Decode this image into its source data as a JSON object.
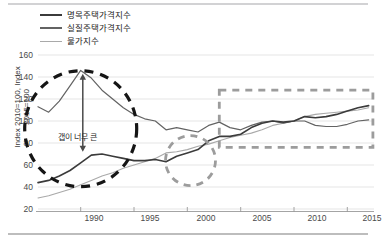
{
  "chart_data": {
    "type": "line",
    "title": "",
    "xlabel": "",
    "ylabel": "Index 2010=100, Index 2015=100",
    "xlim": [
      1986,
      2017.5
    ],
    "ylim": [
      20,
      160
    ],
    "yticks": [
      20,
      40,
      60,
      80,
      100,
      120,
      140,
      160
    ],
    "xticks": [
      1990,
      1995,
      2000,
      2005,
      2010,
      2015
    ],
    "grid": true,
    "legend_position": "top-left",
    "series": [
      {
        "name": "명목주택가격지수",
        "color": "#3b3b3b",
        "x": [
          1986,
          1987,
          1988,
          1989,
          1990,
          1991,
          1992,
          1993,
          1994,
          1995,
          1996,
          1997,
          1998,
          1999,
          2000,
          2001,
          2002,
          2003,
          2004,
          2005,
          2006,
          2007,
          2008,
          2009,
          2010,
          2011,
          2012,
          2013,
          2014,
          2015,
          2016,
          2017
        ],
        "values": [
          44,
          46,
          50,
          55,
          62,
          69,
          70,
          68,
          66,
          64,
          64,
          65,
          63,
          68,
          71,
          74,
          82,
          86,
          86,
          88,
          94,
          98,
          100,
          99,
          100,
          104,
          103,
          104,
          106,
          109,
          112,
          114
        ]
      },
      {
        "name": "실질주택가격지수",
        "color": "#636363",
        "x": [
          1986,
          1987,
          1988,
          1989,
          1990,
          1991,
          1992,
          1993,
          1994,
          1995,
          1996,
          1997,
          1998,
          1999,
          2000,
          2001,
          2002,
          2003,
          2004,
          2005,
          2006,
          2007,
          2008,
          2009,
          2010,
          2011,
          2012,
          2013,
          2014,
          2015,
          2016,
          2017
        ],
        "values": [
          113,
          108,
          118,
          132,
          146,
          139,
          128,
          120,
          112,
          106,
          102,
          100,
          92,
          94,
          92,
          90,
          96,
          99,
          94,
          92,
          96,
          99,
          100,
          98,
          100,
          100,
          96,
          95,
          95,
          97,
          100,
          101
        ]
      },
      {
        "name": "물가지수",
        "color": "#a9a9a9",
        "x": [
          1986,
          1987,
          1988,
          1989,
          1990,
          1991,
          1992,
          1993,
          1994,
          1995,
          1996,
          1997,
          1998,
          1999,
          2000,
          2001,
          2002,
          2003,
          2004,
          2005,
          2006,
          2007,
          2008,
          2009,
          2010,
          2011,
          2012,
          2013,
          2014,
          2015,
          2016,
          2017
        ],
        "values": [
          30,
          32,
          35,
          38,
          42,
          46,
          50,
          53,
          57,
          60,
          63,
          66,
          71,
          72,
          74,
          77,
          79,
          82,
          85,
          87,
          89,
          92,
          96,
          98,
          100,
          104,
          106,
          107,
          108,
          109,
          110,
          112
        ]
      }
    ],
    "annotations": [
      {
        "name": "gap-label",
        "text": "갭이 너무 큰",
        "x": 1992.0,
        "y": 86
      },
      {
        "name": "gap-arrow",
        "text": "",
        "x": 1990.2,
        "y_top": 143,
        "y_bottom": 72
      },
      {
        "name": "bubble-circle",
        "text": "",
        "cx": 1990.0,
        "cy": 93
      },
      {
        "name": "trough-circle",
        "text": "",
        "cx": 2000.3,
        "cy": 64
      },
      {
        "name": "recent-box",
        "text": "",
        "x0": 2003.0,
        "x1": 2017.4,
        "y0": 76,
        "y1": 128
      }
    ]
  },
  "legend": {
    "items": [
      {
        "label": "명목주택가격지수",
        "color": "#3b3b3b"
      },
      {
        "label": "실질주택가격지수",
        "color": "#636363"
      },
      {
        "label": "물가지수",
        "color": "#a9a9a9"
      }
    ]
  },
  "axes": {
    "y_title": "Index 2010=100, Index 2015=100",
    "y_ticks": [
      "160",
      "140",
      "120",
      "100",
      "80",
      "60",
      "40",
      "20"
    ],
    "x_ticks": [
      "1990",
      "1995",
      "2000",
      "2005",
      "2010",
      "2015"
    ]
  },
  "annotation_text": {
    "gap": "갭이 너무 큰"
  }
}
